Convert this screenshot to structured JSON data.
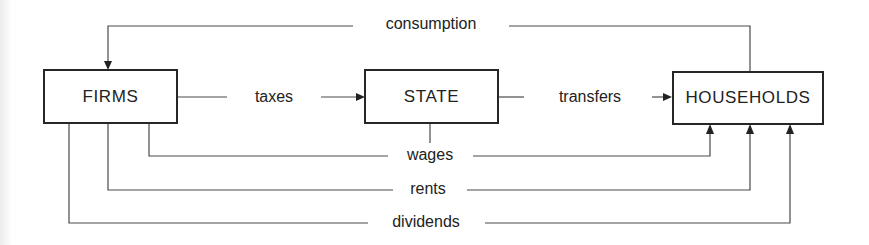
{
  "diagram": {
    "nodes": [
      {
        "id": "firms",
        "label": "FIRMS"
      },
      {
        "id": "state",
        "label": "STATE"
      },
      {
        "id": "households",
        "label": "HOUSEHOLDS"
      }
    ],
    "flows": {
      "consumption": {
        "label": "consumption",
        "from": "households",
        "to": "firms"
      },
      "taxes": {
        "label": "taxes",
        "from": "firms",
        "to": "state"
      },
      "transfers": {
        "label": "transfers",
        "from": "state",
        "to": "households"
      },
      "wages": {
        "label": "wages",
        "from": "firms and state",
        "to": "households"
      },
      "rents": {
        "label": "rents",
        "from": "firms",
        "to": "households"
      },
      "dividends": {
        "label": "dividends",
        "from": "firms",
        "to": "households"
      }
    },
    "colors": {
      "line": "#4a4a4a",
      "box_border": "#262626",
      "text": "#222222",
      "background": "#ffffff"
    }
  }
}
